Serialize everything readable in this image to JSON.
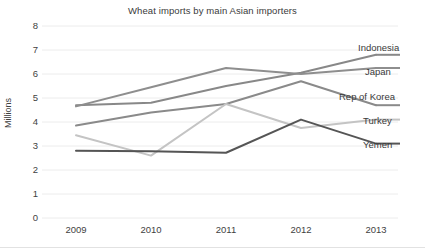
{
  "chart_data": {
    "type": "line",
    "title": "Wheat imports by main Asian importers",
    "xlabel": "",
    "ylabel": "Millions",
    "categories": [
      "2009",
      "2010",
      "2011",
      "2012",
      "2013"
    ],
    "x": [
      2009,
      2010,
      2011,
      2012,
      2013
    ],
    "ylim": [
      0,
      8
    ],
    "yticks": [
      0,
      1,
      2,
      3,
      4,
      5,
      6,
      7,
      8
    ],
    "ytick_labels": [
      "0",
      "1",
      "2",
      "3",
      "4",
      "5",
      "6",
      "7",
      "8"
    ],
    "grid": true,
    "legend_position": "right-of-line-ends",
    "series": [
      {
        "name": "Indonesia",
        "values": [
          4.7,
          4.8,
          5.5,
          6.05,
          6.8
        ],
        "color": "#888888"
      },
      {
        "name": "Japan",
        "values": [
          4.65,
          5.45,
          6.25,
          6.0,
          6.25
        ],
        "color": "#8e8e8e"
      },
      {
        "name": "Rep of Korea",
        "values": [
          3.85,
          4.4,
          4.75,
          5.7,
          4.7
        ],
        "color": "#8a8a8a"
      },
      {
        "name": "Turkey",
        "values": [
          3.45,
          2.6,
          4.75,
          3.75,
          4.1
        ],
        "color": "#c4c4c4"
      },
      {
        "name": "Yemen",
        "values": [
          2.8,
          2.78,
          2.72,
          4.1,
          3.1
        ],
        "color": "#555555"
      }
    ]
  },
  "colors": {
    "background": "#ffffff",
    "gridline": "#ececec",
    "text": "#3a3a3a"
  }
}
